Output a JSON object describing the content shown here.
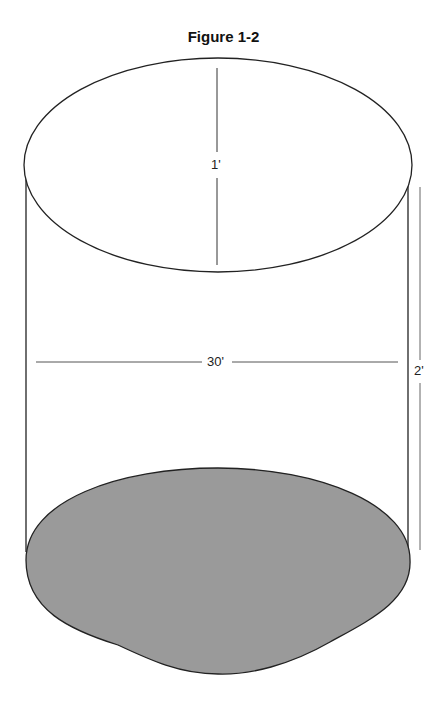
{
  "figure": {
    "title": "Figure 1-2",
    "labels": {
      "diameter_top": "1'",
      "width": "30'",
      "height": "2'"
    },
    "colors": {
      "stroke": "#222222",
      "fill_bottom": "#9a9a9a",
      "background": "#ffffff"
    }
  }
}
